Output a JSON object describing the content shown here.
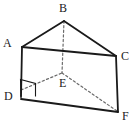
{
  "figure": {
    "name": "triangular-prism-diagram",
    "kind": "geometry-solid",
    "solid": "triangular prism",
    "background_color": "#ffffff",
    "stroke_color": "#1a1a1a",
    "hidden_stroke_color": "#6b6b6b",
    "canvas": {
      "width": 138,
      "height": 128
    }
  },
  "labels": {
    "A": "A",
    "B": "B",
    "C": "C",
    "D": "D",
    "E": "E",
    "F": "F"
  },
  "label_positions": {
    "A": {
      "x": 3,
      "y": 37
    },
    "B": {
      "x": 59,
      "y": 2
    },
    "C": {
      "x": 121,
      "y": 50
    },
    "D": {
      "x": 4,
      "y": 90
    },
    "E": {
      "x": 59,
      "y": 77
    },
    "F": {
      "x": 122,
      "y": 110
    }
  },
  "vertices": {
    "A": {
      "x": 22,
      "y": 47
    },
    "B": {
      "x": 64,
      "y": 21
    },
    "C": {
      "x": 116,
      "y": 56
    },
    "D": {
      "x": 21,
      "y": 97
    },
    "E": {
      "x": 62,
      "y": 73
    },
    "F": {
      "x": 118,
      "y": 112
    }
  },
  "edges": {
    "solid": [
      {
        "name": "edge-A-B",
        "from": "A",
        "to": "B"
      },
      {
        "name": "edge-B-C",
        "from": "B",
        "to": "C"
      },
      {
        "name": "edge-A-C",
        "from": "A",
        "to": "C"
      },
      {
        "name": "edge-A-D",
        "from": "A",
        "to": "D"
      },
      {
        "name": "edge-C-F",
        "from": "C",
        "to": "F"
      },
      {
        "name": "edge-D-F",
        "from": "D",
        "to": "F"
      }
    ],
    "hidden": [
      {
        "name": "edge-B-E",
        "from": "B",
        "to": "E"
      },
      {
        "name": "edge-D-E",
        "from": "D",
        "to": "E"
      },
      {
        "name": "edge-E-F",
        "from": "E",
        "to": "F"
      }
    ]
  },
  "markers": {
    "right_angle": {
      "name": "right-angle-marker-at-D",
      "at_vertex": "D",
      "points": "21,97 20,79 36,83 36,97"
    }
  }
}
